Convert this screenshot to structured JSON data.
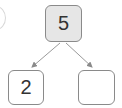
{
  "diagram": {
    "type": "number-bond",
    "whole": {
      "value": "5"
    },
    "parts": [
      {
        "value": "2"
      },
      {
        "value": ""
      }
    ]
  }
}
